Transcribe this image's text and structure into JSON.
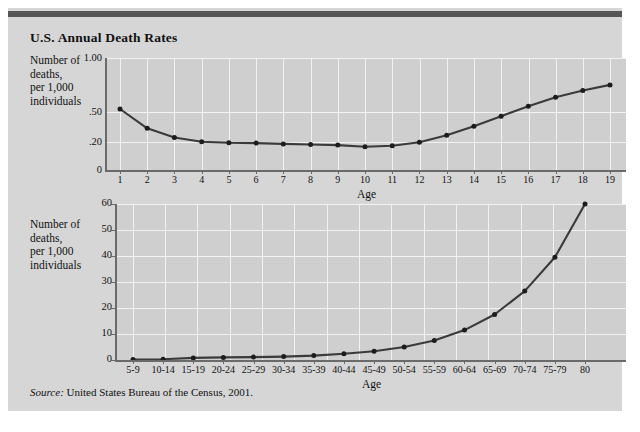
{
  "figure": {
    "title": "U.S. Annual Death Rates",
    "source_label": "Source:",
    "source_text": "United States Bureau of the Census, 2001.",
    "panel_color": "#d6d6d6",
    "plot_color": "#cfcfcf",
    "grid_color": "#f2f2f2",
    "axis_color": "#6a6a6a",
    "line_color": "#3a3a3a",
    "rule_color": "#555555"
  },
  "chart_data": [
    {
      "type": "line",
      "title": "U.S. Annual Death Rates",
      "subtitle": "Ages 1 to 19",
      "xlabel": "Age",
      "ylabel": "Number of deaths, per 1,000 individuals",
      "ylabel_lines": [
        "Number of",
        "deaths,",
        "per 1,000",
        "individuals"
      ],
      "grid": true,
      "legend": "none",
      "yticks": [
        "0",
        ".20",
        ".50",
        "1.00"
      ],
      "ytick_values": [
        0,
        0.2,
        0.5,
        1.0
      ],
      "ytick_positions": [
        0,
        0.25,
        0.52,
        1.0
      ],
      "ylim": [
        0,
        1.0
      ],
      "axis_scale": "nonlinear",
      "categories": [
        "1",
        "2",
        "3",
        "4",
        "5",
        "6",
        "7",
        "8",
        "9",
        "10",
        "11",
        "12",
        "13",
        "14",
        "15",
        "16",
        "17",
        "18",
        "19"
      ],
      "x": [
        1,
        2,
        3,
        4,
        5,
        6,
        7,
        8,
        9,
        10,
        11,
        12,
        13,
        14,
        15,
        16,
        17,
        18,
        19
      ],
      "values": [
        0.56,
        0.36,
        0.26,
        0.21,
        0.2,
        0.2,
        0.19,
        0.19,
        0.18,
        0.17,
        0.18,
        0.21,
        0.27,
        0.34,
        0.44,
        0.56,
        0.66,
        0.74,
        0.81
      ],
      "values_plot_fraction": [
        0.545,
        0.372,
        0.29,
        0.253,
        0.243,
        0.24,
        0.233,
        0.228,
        0.222,
        0.208,
        0.217,
        0.247,
        0.31,
        0.39,
        0.48,
        0.57,
        0.65,
        0.71,
        0.76
      ]
    },
    {
      "type": "line",
      "subtitle": "Ages 5 to 80",
      "xlabel": "Age",
      "ylabel": "Number of deaths, per 1,000 individuals",
      "ylabel_lines": [
        "Number of",
        "deaths,",
        "per 1,000",
        "individuals"
      ],
      "grid": true,
      "legend": "none",
      "yticks": [
        "0",
        "10",
        "20",
        "30",
        "40",
        "50",
        "60"
      ],
      "ytick_values": [
        0,
        10,
        20,
        30,
        40,
        50,
        60
      ],
      "ylim": [
        0,
        60
      ],
      "axis_scale": "linear",
      "categories": [
        "5-9",
        "10-14",
        "15-19",
        "20-24",
        "25-29",
        "30-34",
        "35-39",
        "40-44",
        "45-49",
        "50-54",
        "55-59",
        "60-64",
        "65-69",
        "70-74",
        "75-79",
        "80"
      ],
      "values": [
        0.2,
        0.3,
        0.8,
        1.0,
        1.1,
        1.3,
        1.7,
        2.4,
        3.4,
        5.0,
        7.5,
        11.5,
        17.5,
        26.5,
        39.5,
        60.0
      ]
    }
  ]
}
